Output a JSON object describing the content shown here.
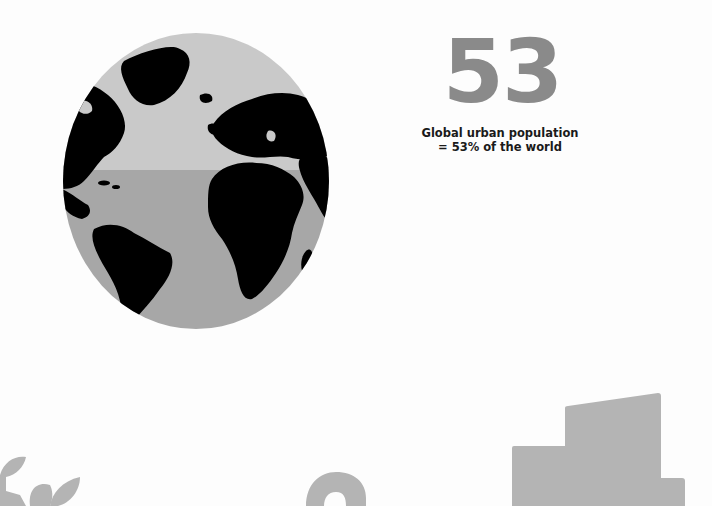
{
  "globe": {
    "icon": "globe-icon",
    "colors": {
      "upper_ocean": "#c9c9c9",
      "lower_ocean": "#a7a7a7",
      "land": "#000000"
    }
  },
  "stat": {
    "number": "53",
    "caption_line1": "Global urban population",
    "caption_line2": "= 53% of the world",
    "number_color": "#8a8a8a"
  },
  "decorations": {
    "plant": "plant-sprout-icon",
    "digit": "2",
    "buildings": "buildings-icon",
    "color": "#b4b4b4"
  }
}
